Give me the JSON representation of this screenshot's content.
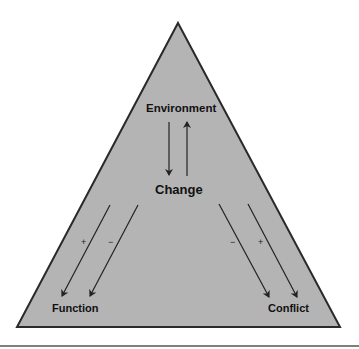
{
  "diagram": {
    "type": "triangle-model",
    "nodes": {
      "top": "Environment",
      "center": "Change",
      "bottom_left": "Function",
      "bottom_right": "Conflict"
    },
    "signs": {
      "left_outer": "+",
      "left_inner": "−",
      "right_inner": "−",
      "right_outer": "+"
    },
    "edges": [
      {
        "from": "Environment",
        "to": "Change"
      },
      {
        "from": "Change",
        "to": "Environment"
      },
      {
        "from": "Change",
        "to": "Function",
        "sign": "+"
      },
      {
        "from": "Change",
        "to": "Function",
        "sign": "−"
      },
      {
        "from": "Change",
        "to": "Conflict",
        "sign": "−"
      },
      {
        "from": "Change",
        "to": "Conflict",
        "sign": "+"
      }
    ],
    "colors": {
      "fill": "#b4b4b4",
      "stroke": "#2a2a2a",
      "text": "#111111"
    }
  }
}
